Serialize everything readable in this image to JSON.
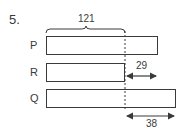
{
  "question_number": "5.",
  "bars": [
    {
      "label": "P"
    },
    {
      "label": "R"
    },
    {
      "label": "Q"
    }
  ],
  "annotations": {
    "brace_value": "121",
    "r_difference": "29",
    "q_difference": "38"
  },
  "colors": {
    "stroke": "#3a3a3a",
    "background": "#ffffff"
  }
}
